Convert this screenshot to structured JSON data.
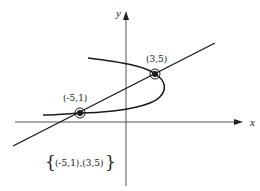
{
  "diagram": {
    "type": "system-of-equations-graph",
    "axes": {
      "x_label": "x",
      "y_label": "y"
    },
    "curves": [
      {
        "name": "parabola",
        "description": "sideways parabola opening left"
      },
      {
        "name": "line",
        "description": "straight line with positive slope"
      }
    ],
    "intersection_points": [
      {
        "label": "(3,5)",
        "x": 3,
        "y": 5
      },
      {
        "label": "(-5,1)",
        "x": -5,
        "y": 1
      }
    ],
    "solution_set": {
      "open_brace": "{",
      "text": "(-5,1),(3,5)",
      "close_brace": "}"
    },
    "colors": {
      "stroke": "#1a1a1a",
      "axis": "#555555",
      "background": "#ffffff"
    }
  }
}
